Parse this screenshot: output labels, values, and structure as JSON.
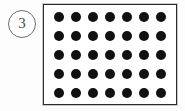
{
  "figure": {
    "label": {
      "text": "3",
      "shape": "circle-outline",
      "icon_name": "circled-number-badge"
    },
    "panel": {
      "border_color": "#2b2b2b",
      "background_color": "#ffffff"
    },
    "background_color": "#fdfdfd"
  },
  "chart_data": {
    "type": "scatter",
    "title": "",
    "subtitle": "",
    "xlabel": "",
    "ylabel": "",
    "grid": false,
    "legend": null,
    "annotations": [
      "3"
    ],
    "marker": {
      "shape": "circle",
      "filled": true,
      "color": "#111111",
      "diameter_px": 10
    },
    "rows": 5,
    "columns": 7,
    "total_points": 35,
    "x": [
      1,
      2,
      3,
      4,
      5,
      6,
      7
    ],
    "y": [
      1,
      2,
      3,
      4,
      5
    ],
    "xlim": [
      0,
      8
    ],
    "ylim": [
      0,
      6
    ],
    "grid_rows": [
      {
        "row": 1,
        "count": 7
      },
      {
        "row": 2,
        "count": 7
      },
      {
        "row": 3,
        "count": 7
      },
      {
        "row": 4,
        "count": 7
      },
      {
        "row": 5,
        "count": 7
      }
    ]
  }
}
